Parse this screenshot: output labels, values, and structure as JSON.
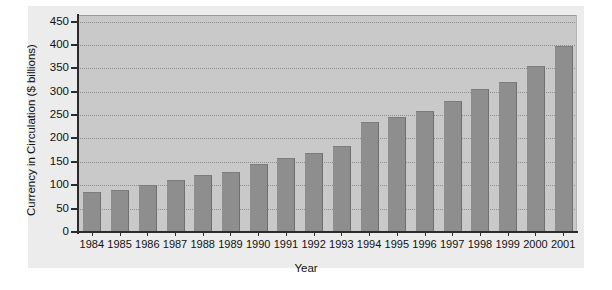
{
  "chart_data": {
    "type": "bar",
    "title": "",
    "xlabel": "Year",
    "ylabel": "Currency in Circulation ($ billions)",
    "categories": [
      "1984",
      "1985",
      "1986",
      "1987",
      "1988",
      "1989",
      "1990",
      "1991",
      "1992",
      "1993",
      "1994",
      "1995",
      "1996",
      "1997",
      "1998",
      "1999",
      "2000",
      "2001"
    ],
    "values": [
      85,
      90,
      100,
      112,
      122,
      128,
      145,
      158,
      168,
      185,
      235,
      245,
      258,
      280,
      305,
      320,
      355,
      398
    ],
    "ylim": [
      0,
      450
    ],
    "ytick_step": 50,
    "ytick_labels": [
      "0",
      "50",
      "100",
      "150",
      "200",
      "250",
      "300",
      "350",
      "400",
      "450"
    ],
    "grid": true,
    "legend": "none",
    "colors": {
      "bar": "#8e8e8e",
      "plot_background": "#c9c9c9",
      "panel_background": "#ececec",
      "page_background": "#ffffff",
      "axis": "#2b2b2b",
      "gridline": "#8e8e8e",
      "text": "#111111"
    }
  }
}
